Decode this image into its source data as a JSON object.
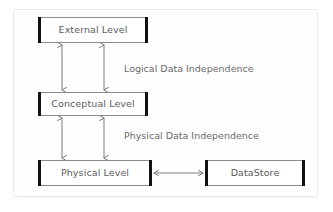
{
  "diagram": {
    "background_color": "#ffffff",
    "card_color": "#fefefe",
    "card_border_color": "#eceaea",
    "node_border_color": "#8d8d8d",
    "node_endbar_color": "#111111",
    "node_text_color": "#5b5b5b",
    "edge_label_color": "#6a6a6a",
    "arrow_color": "#7a7a7a"
  },
  "nodes": [
    {
      "id": "external",
      "label": "External Level"
    },
    {
      "id": "conceptual",
      "label": "Conceptual Level"
    },
    {
      "id": "physical",
      "label": "Physical Level"
    },
    {
      "id": "datastore",
      "label": "DataStore"
    }
  ],
  "edges": [
    {
      "id": "logical",
      "label": "Logical Data Independence",
      "from": "external",
      "to": "conceptual",
      "style": "double-headed-vertical",
      "count": 2
    },
    {
      "id": "physical",
      "label": "Physical Data Independence",
      "from": "conceptual",
      "to": "physical",
      "style": "double-headed-vertical",
      "count": 2
    },
    {
      "id": "storage-link",
      "label": "",
      "from": "physical",
      "to": "datastore",
      "style": "double-headed-horizontal",
      "count": 1
    }
  ],
  "labels": {
    "logical": "Logical Data Independence",
    "physical": "Physical Data Independence"
  }
}
